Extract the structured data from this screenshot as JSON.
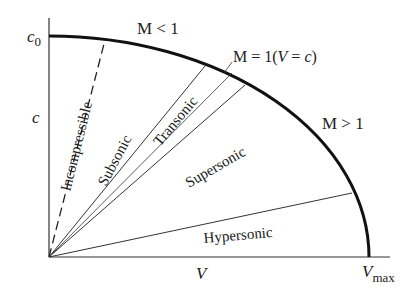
{
  "diagram": {
    "type": "velocity-speed-of-sound ellipse",
    "axes": {
      "x_label": "V",
      "x_end_label": "V",
      "x_end_sub": "max",
      "y_label": "c",
      "y_top_label": "c",
      "y_top_sub": "0"
    },
    "regions": [
      {
        "label": "Incompressible"
      },
      {
        "label": "Subsonic"
      },
      {
        "label": "Transonic"
      },
      {
        "label": "Supersonic"
      },
      {
        "label": "Hypersonic"
      }
    ],
    "annotations": {
      "subsonic_side": "M < 1",
      "sonic_line": "M = 1(",
      "sonic_v": "V",
      "sonic_eq": " = ",
      "sonic_c": "c",
      "sonic_close": ")",
      "supersonic_side": "M > 1"
    }
  }
}
